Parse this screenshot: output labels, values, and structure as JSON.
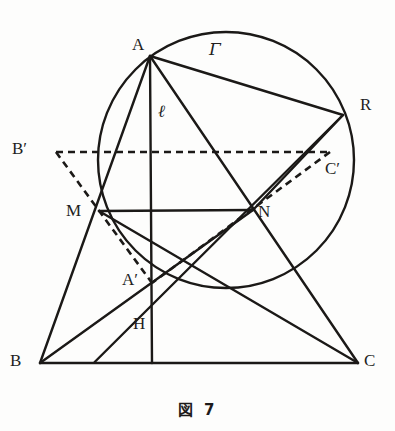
{
  "figure": {
    "caption": "図 7",
    "top_cut_text": "",
    "ink_color": "#1b1917",
    "background_color": "#fdfdfc"
  },
  "labels": {
    "A": "A",
    "Gamma": "Γ",
    "R": "R",
    "ell": "ℓ",
    "Bprime": "B′",
    "Cprime": "C′",
    "M": "M",
    "N": "N",
    "Aprime": "A′",
    "H": "H",
    "B": "B",
    "C": "C"
  },
  "label_positions": {
    "A": {
      "x": 132,
      "y": 36
    },
    "Gamma": {
      "x": 209,
      "y": 41
    },
    "R": {
      "x": 360,
      "y": 96
    },
    "ell": {
      "x": 158,
      "y": 103
    },
    "Bprime": {
      "x": 12,
      "y": 140
    },
    "Cprime": {
      "x": 325,
      "y": 160
    },
    "M": {
      "x": 66,
      "y": 202
    },
    "N": {
      "x": 258,
      "y": 203
    },
    "Aprime": {
      "x": 122,
      "y": 271
    },
    "H": {
      "x": 133,
      "y": 315
    },
    "B": {
      "x": 10,
      "y": 352
    },
    "C": {
      "x": 364,
      "y": 352
    }
  },
  "geometry": {
    "circle": {
      "cx": 226,
      "cy": 160,
      "r": 128,
      "name": "circumcircle-gamma"
    },
    "points": {
      "A": {
        "x": 150,
        "y": 56
      },
      "R": {
        "x": 343,
        "y": 115
      },
      "M": {
        "x": 99,
        "y": 211
      },
      "N": {
        "x": 253,
        "y": 210
      },
      "Aprime": {
        "x": 152,
        "y": 283
      },
      "H": {
        "x": 152,
        "y": 305
      },
      "B": {
        "x": 40,
        "y": 363
      },
      "C": {
        "x": 358,
        "y": 363
      },
      "Bprime": {
        "x": 56,
        "y": 152
      },
      "Cprime": {
        "x": 330,
        "y": 152
      },
      "Lfoot": {
        "x": 152,
        "y": 363
      }
    },
    "solid_segments": [
      {
        "name": "segment-A-B",
        "from": "A",
        "to": "B"
      },
      {
        "name": "segment-A-C",
        "from": "A",
        "to": "C"
      },
      {
        "name": "segment-B-C",
        "from": "B",
        "to": "C"
      },
      {
        "name": "segment-A-R",
        "from": "A",
        "to": "R"
      },
      {
        "name": "segment-R-N",
        "from": "R",
        "to": "N"
      },
      {
        "name": "segment-M-N",
        "from": "M",
        "to": "N"
      },
      {
        "name": "segment-M-C",
        "from": "M",
        "to": "C"
      },
      {
        "name": "segment-N-B",
        "from": "N",
        "to": "B"
      },
      {
        "name": "line-ell-A-to-foot",
        "from": "A",
        "to": "Lfoot"
      },
      {
        "name": "segment-R-H-extended",
        "from": "R",
        "to": "H"
      }
    ],
    "dashed_segments": [
      {
        "name": "segment-Bprime-Cprime",
        "from": "Bprime",
        "to": "Cprime"
      },
      {
        "name": "segment-Bprime-Aprime",
        "from": "Bprime",
        "to": "Aprime"
      },
      {
        "name": "segment-Cprime-Aprime",
        "from": "Cprime",
        "to": "Aprime"
      }
    ]
  }
}
